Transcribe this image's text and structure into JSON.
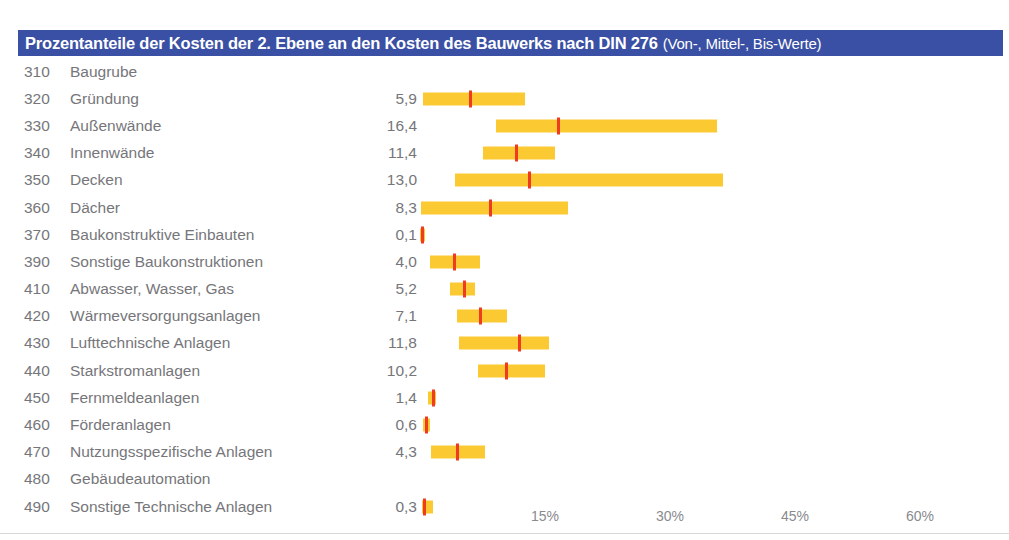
{
  "title": {
    "main": "Prozentanteile der Kosten der 2. Ebene an den Kosten des Bauwerks nach DIN 276",
    "sub": "(Von-, Mittel-, Bis-Werte)",
    "bar_color": "#3a50a4",
    "text_color": "#ffffff"
  },
  "colors": {
    "range_bar": "#fbc932",
    "mid_marker": "#ef3b22",
    "label_text": "#76767a",
    "axis_text": "#8a8a8e"
  },
  "chart_data": {
    "type": "bar",
    "title": "Prozentanteile der Kosten der 2. Ebene an den Kosten des Bauwerks nach DIN 276 (Von-, Mittel-, Bis-Werte)",
    "xlabel": "",
    "ylabel": "",
    "xlim": [
      0,
      67
    ],
    "grid": false,
    "legend": "none",
    "xticks": [
      15,
      30,
      45,
      60
    ],
    "xticklabels": [
      "15%",
      "30%",
      "45%",
      "60%"
    ],
    "value_format": "comma-decimal",
    "series": [
      {
        "name": "Von-Wert",
        "role": "range_start"
      },
      {
        "name": "Mittel-Wert",
        "role": "marker"
      },
      {
        "name": "Bis-Wert",
        "role": "range_end"
      }
    ],
    "categories": [
      {
        "code": "310",
        "label": "Baugrube",
        "mid": null,
        "mid_label": "",
        "von": null,
        "bis": null
      },
      {
        "code": "320",
        "label": "Gründung",
        "mid": 5.9,
        "mid_label": "5,9",
        "von": 0.4,
        "bis": 12.6
      },
      {
        "code": "330",
        "label": "Außenwände",
        "mid": 16.4,
        "mid_label": "16,4",
        "von": 9.1,
        "bis": 35.6
      },
      {
        "code": "340",
        "label": "Innenwände",
        "mid": 11.4,
        "mid_label": "11,4",
        "von": 7.6,
        "bis": 16.2
      },
      {
        "code": "350",
        "label": "Decken",
        "mid": 13.0,
        "mid_label": "13,0",
        "von": 4.2,
        "bis": 36.4
      },
      {
        "code": "360",
        "label": "Dächer",
        "mid": 8.3,
        "mid_label": "8,3",
        "von": 0.1,
        "bis": 17.8
      },
      {
        "code": "370",
        "label": "Baukonstruktive Einbauten",
        "mid": 0.1,
        "mid_label": "0,1",
        "von": 0.0,
        "bis": 0.3
      },
      {
        "code": "390",
        "label": "Sonstige Baukonstruktionen",
        "mid": 4.0,
        "mid_label": "4,0",
        "von": 1.2,
        "bis": 7.2
      },
      {
        "code": "410",
        "label": "Abwasser, Wasser, Gas",
        "mid": 5.2,
        "mid_label": "5,2",
        "von": 3.6,
        "bis": 6.6
      },
      {
        "code": "420",
        "label": "Wärmeversorgungsanlagen",
        "mid": 7.1,
        "mid_label": "7,1",
        "von": 4.4,
        "bis": 10.4
      },
      {
        "code": "430",
        "label": "Lufttechnische Anlagen",
        "mid": 11.8,
        "mid_label": "11,8",
        "von": 4.7,
        "bis": 15.5
      },
      {
        "code": "440",
        "label": "Starkstromanlagen",
        "mid": 10.2,
        "mid_label": "10,2",
        "von": 7.0,
        "bis": 15.0
      },
      {
        "code": "450",
        "label": "Fernmeldeanlagen",
        "mid": 1.4,
        "mid_label": "1,4",
        "von": 1.0,
        "bis": 1.9
      },
      {
        "code": "460",
        "label": "Förderanlagen",
        "mid": 0.6,
        "mid_label": "0,6",
        "von": 0.4,
        "bis": 1.2
      },
      {
        "code": "470",
        "label": "Nutzungsspezifische Anlagen",
        "mid": 4.3,
        "mid_label": "4,3",
        "von": 1.3,
        "bis": 7.8
      },
      {
        "code": "480",
        "label": "Gebäudeautomation",
        "mid": null,
        "mid_label": "",
        "von": null,
        "bis": null
      },
      {
        "code": "490",
        "label": "Sonstige Technische Anlagen",
        "mid": 0.3,
        "mid_label": "0,3",
        "von": 0.2,
        "bis": 1.6
      }
    ]
  }
}
